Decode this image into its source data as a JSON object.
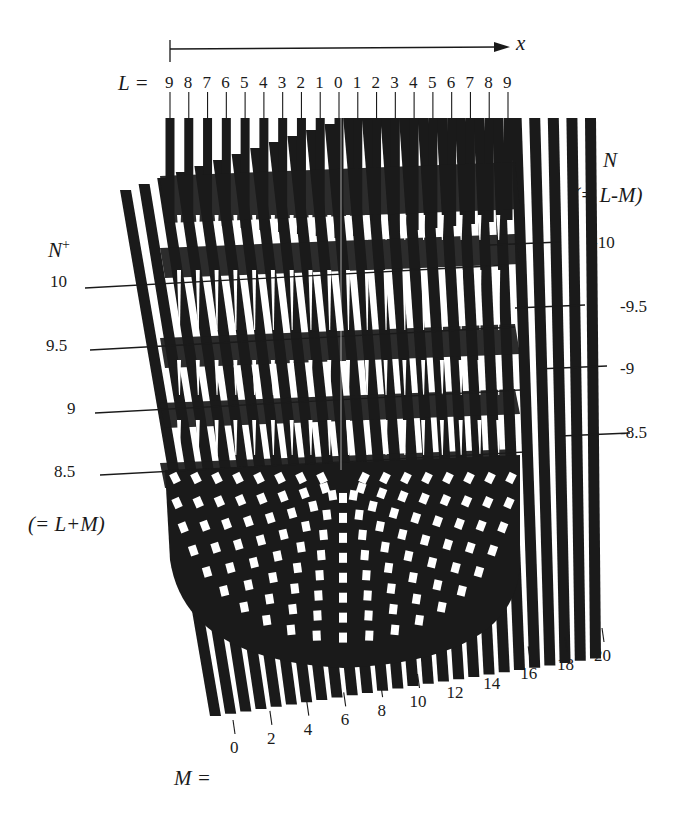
{
  "figure": {
    "axis": {
      "label": "x"
    },
    "L_row": {
      "prefix": "L =",
      "labels": [
        "9",
        "8",
        "7",
        "6",
        "5",
        "4",
        "3",
        "2",
        "1",
        "0",
        "1",
        "2",
        "3",
        "4",
        "5",
        "6",
        "7",
        "8",
        "9"
      ]
    },
    "M_row": {
      "prefix": "M =",
      "labels": [
        "0",
        "2",
        "4",
        "6",
        "8",
        "10",
        "12",
        "14",
        "16",
        "18",
        "20"
      ]
    },
    "N_plus": {
      "title": "N",
      "title_sup": "+",
      "note": "(= L+M)",
      "ticks": [
        "10",
        "9.5",
        "9",
        "8.5"
      ]
    },
    "N_minus": {
      "title": "N",
      "note": "(= L-M)",
      "ticks": [
        "-10",
        "-9.5",
        "-9",
        "-8.5"
      ]
    },
    "colors": {
      "ink": "#1a1a1a",
      "paper": "#ffffff"
    }
  }
}
